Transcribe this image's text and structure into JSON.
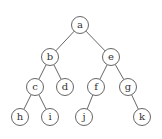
{
  "diagram": {
    "type": "binary-tree",
    "nodes": [
      {
        "id": "a",
        "label": "a",
        "x": 80,
        "y": 25
      },
      {
        "id": "b",
        "label": "b",
        "x": 50,
        "y": 57
      },
      {
        "id": "e",
        "label": "e",
        "x": 111,
        "y": 57
      },
      {
        "id": "c",
        "label": "c",
        "x": 35,
        "y": 87
      },
      {
        "id": "d",
        "label": "d",
        "x": 65,
        "y": 87
      },
      {
        "id": "f",
        "label": "f",
        "x": 96,
        "y": 87
      },
      {
        "id": "g",
        "label": "g",
        "x": 128,
        "y": 87
      },
      {
        "id": "h",
        "label": "h",
        "x": 20,
        "y": 117
      },
      {
        "id": "i",
        "label": "i",
        "x": 50,
        "y": 117
      },
      {
        "id": "j",
        "label": "j",
        "x": 84,
        "y": 117
      },
      {
        "id": "k",
        "label": "k",
        "x": 142,
        "y": 117
      }
    ],
    "edges": [
      [
        "a",
        "b"
      ],
      [
        "a",
        "e"
      ],
      [
        "b",
        "c"
      ],
      [
        "b",
        "d"
      ],
      [
        "e",
        "f"
      ],
      [
        "e",
        "g"
      ],
      [
        "c",
        "h"
      ],
      [
        "c",
        "i"
      ],
      [
        "f",
        "j"
      ],
      [
        "g",
        "k"
      ]
    ]
  }
}
